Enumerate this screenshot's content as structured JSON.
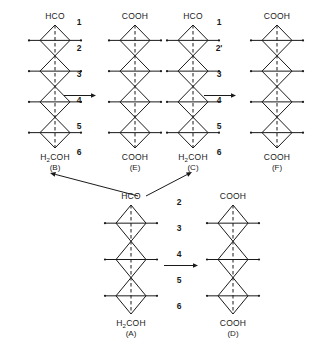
{
  "figure": {
    "background_color": "#ffffff",
    "line_color": "#1a1a1a",
    "width": 320,
    "height": 344
  },
  "molecules": {
    "B": {
      "name": "(B)",
      "top_group": "HCO",
      "bottom_group": "H₂COH",
      "units": 4,
      "x": 22,
      "y": 12,
      "width": 66,
      "height": 160
    },
    "E": {
      "name": "(E)",
      "top_group": "COOH",
      "bottom_group": "COOH",
      "units": 4,
      "x": 100,
      "y": 12,
      "width": 70,
      "height": 160
    },
    "C": {
      "name": "(C)",
      "top_group": "HCO",
      "bottom_group": "H₂COH",
      "units": 4,
      "x": 158,
      "y": 12,
      "width": 70,
      "height": 160
    },
    "F": {
      "name": "(F)",
      "top_group": "COOH",
      "bottom_group": "COOH",
      "units": 4,
      "x": 242,
      "y": 12,
      "width": 70,
      "height": 160
    },
    "A": {
      "name": "(A)",
      "top_group": "HCO",
      "bottom_group": "H₂COH",
      "units": 3,
      "x": 98,
      "y": 192,
      "width": 66,
      "height": 146
    },
    "D": {
      "name": "(D)",
      "top_group": "COOH",
      "bottom_group": "COOH",
      "units": 3,
      "x": 200,
      "y": 192,
      "width": 66,
      "height": 146
    }
  },
  "number_columns": {
    "left": {
      "labels": [
        "1",
        "2",
        "3",
        "4",
        "5",
        "6"
      ],
      "x": 66,
      "y": 18,
      "width": 26,
      "spacing": 26
    },
    "right": {
      "labels": [
        "1",
        "2'",
        "3",
        "4",
        "5",
        "6"
      ],
      "x": 206,
      "y": 18,
      "width": 26,
      "spacing": 26
    },
    "bottom": {
      "labels": [
        "2",
        "3",
        "4",
        "5",
        "6"
      ],
      "x": 166,
      "y": 198,
      "width": 26,
      "spacing": 26
    }
  },
  "arrows": {
    "horizontal": [
      {
        "name": "arrow-b-to-e",
        "x": 64,
        "y": 91,
        "length": 32
      },
      {
        "name": "arrow-c-to-f",
        "x": 204,
        "y": 91,
        "length": 32
      },
      {
        "name": "arrow-a-to-d",
        "x": 164,
        "y": 261,
        "length": 34
      }
    ],
    "diagonal": [
      {
        "name": "arrow-a-to-b",
        "x1": 138,
        "y1": 196,
        "x2": 50,
        "y2": 173
      },
      {
        "name": "arrow-a-to-c",
        "x1": 146,
        "y1": 196,
        "x2": 192,
        "y2": 172
      }
    ]
  }
}
